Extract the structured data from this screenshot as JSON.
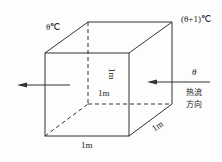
{
  "diagram": {
    "type": "cube-heat-flow",
    "labels": {
      "temp_left": "θ℃",
      "temp_right": "(θ+1)℃",
      "height": "1m",
      "depth_center": "1m",
      "depth_edge": "1m",
      "width": "1m",
      "theta": "θ",
      "heat_flow_line1": "热流",
      "heat_flow_line2": "方向"
    },
    "colors": {
      "line": "#333333",
      "text": "#222222",
      "background": "#fdfdfd"
    }
  }
}
